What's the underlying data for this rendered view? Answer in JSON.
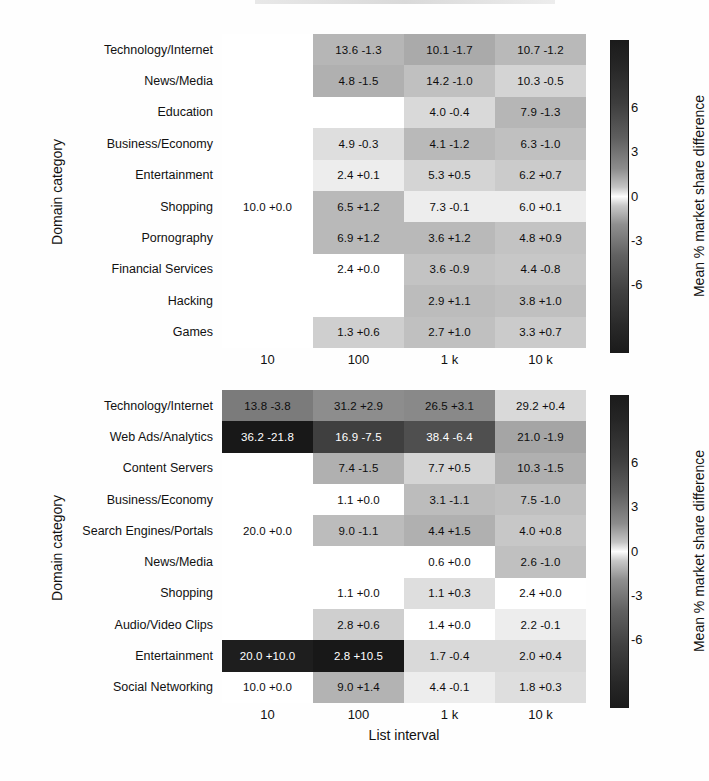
{
  "figure": {
    "y_axis_title": "Domain category",
    "x_axis_title": "List interval",
    "colorbar_title": "Mean % market share difference",
    "colorbar_ticks": [
      "6",
      "3",
      "0",
      "-3",
      "-6"
    ],
    "column_labels": [
      "10",
      "100",
      "1 k",
      "10 k"
    ]
  },
  "chart_data": {
    "type": "heatmap",
    "title": "",
    "xlabel": "List interval",
    "ylabel": "Domain category",
    "colorbar_label": "Mean % market share difference",
    "colorbar_ticks": [
      6,
      3,
      0,
      -3,
      -6
    ],
    "colorbar_range": [
      -10.5,
      10.5
    ],
    "x": [
      "10",
      "100",
      "1 k",
      "10 k"
    ],
    "panels": [
      {
        "panel_index": 0,
        "y": [
          "Technology/Internet",
          "News/Media",
          "Education",
          "Business/Economy",
          "Entertainment",
          "Shopping",
          "Pornography",
          "Financial Services",
          "Hacking",
          "Games"
        ],
        "rows": [
          {
            "label": "Technology/Internet",
            "cells": [
              {
                "text": "",
                "share": null,
                "diff": null
              },
              {
                "text": "13.6 -1.3",
                "share": 13.6,
                "diff": -1.3
              },
              {
                "text": "10.1 -1.7",
                "share": 10.1,
                "diff": -1.7
              },
              {
                "text": "10.7 -1.2",
                "share": 10.7,
                "diff": -1.2
              }
            ]
          },
          {
            "label": "News/Media",
            "cells": [
              {
                "text": "",
                "share": null,
                "diff": null
              },
              {
                "text": "4.8 -1.5",
                "share": 4.8,
                "diff": -1.5
              },
              {
                "text": "14.2 -1.0",
                "share": 14.2,
                "diff": -1.0
              },
              {
                "text": "10.3 -0.5",
                "share": 10.3,
                "diff": -0.5
              }
            ]
          },
          {
            "label": "Education",
            "cells": [
              {
                "text": "",
                "share": null,
                "diff": null
              },
              {
                "text": "",
                "share": null,
                "diff": null
              },
              {
                "text": "4.0 -0.4",
                "share": 4.0,
                "diff": -0.4
              },
              {
                "text": "7.9 -1.3",
                "share": 7.9,
                "diff": -1.3
              }
            ]
          },
          {
            "label": "Business/Economy",
            "cells": [
              {
                "text": "",
                "share": null,
                "diff": null
              },
              {
                "text": "4.9 -0.3",
                "share": 4.9,
                "diff": -0.3
              },
              {
                "text": "4.1 -1.2",
                "share": 4.1,
                "diff": -1.2
              },
              {
                "text": "6.3 -1.0",
                "share": 6.3,
                "diff": -1.0
              }
            ]
          },
          {
            "label": "Entertainment",
            "cells": [
              {
                "text": "",
                "share": null,
                "diff": null
              },
              {
                "text": "2.4 +0.1",
                "share": 2.4,
                "diff": 0.1
              },
              {
                "text": "5.3 +0.5",
                "share": 5.3,
                "diff": 0.5
              },
              {
                "text": "6.2 +0.7",
                "share": 6.2,
                "diff": 0.7
              }
            ]
          },
          {
            "label": "Shopping",
            "cells": [
              {
                "text": "10.0 +0.0",
                "share": 10.0,
                "diff": 0.0
              },
              {
                "text": "6.5 +1.2",
                "share": 6.5,
                "diff": 1.2
              },
              {
                "text": "7.3 -0.1",
                "share": 7.3,
                "diff": -0.1
              },
              {
                "text": "6.0 +0.1",
                "share": 6.0,
                "diff": 0.1
              }
            ]
          },
          {
            "label": "Pornography",
            "cells": [
              {
                "text": "",
                "share": null,
                "diff": null
              },
              {
                "text": "6.9 +1.2",
                "share": 6.9,
                "diff": 1.2
              },
              {
                "text": "3.6 +1.2",
                "share": 3.6,
                "diff": 1.2
              },
              {
                "text": "4.8 +0.9",
                "share": 4.8,
                "diff": 0.9
              }
            ]
          },
          {
            "label": "Financial Services",
            "cells": [
              {
                "text": "",
                "share": null,
                "diff": null
              },
              {
                "text": "2.4 +0.0",
                "share": 2.4,
                "diff": 0.0
              },
              {
                "text": "3.6 -0.9",
                "share": 3.6,
                "diff": -0.9
              },
              {
                "text": "4.4 -0.8",
                "share": 4.4,
                "diff": -0.8
              }
            ]
          },
          {
            "label": "Hacking",
            "cells": [
              {
                "text": "",
                "share": null,
                "diff": null
              },
              {
                "text": "",
                "share": null,
                "diff": null
              },
              {
                "text": "2.9 +1.1",
                "share": 2.9,
                "diff": 1.1
              },
              {
                "text": "3.8 +1.0",
                "share": 3.8,
                "diff": 1.0
              }
            ]
          },
          {
            "label": "Games",
            "cells": [
              {
                "text": "",
                "share": null,
                "diff": null
              },
              {
                "text": "1.3 +0.6",
                "share": 1.3,
                "diff": 0.6
              },
              {
                "text": "2.7 +1.0",
                "share": 2.7,
                "diff": 1.0
              },
              {
                "text": "3.3 +0.7",
                "share": 3.3,
                "diff": 0.7
              }
            ]
          }
        ]
      },
      {
        "panel_index": 1,
        "y": [
          "Technology/Internet",
          "Web Ads/Analytics",
          "Content Servers",
          "Business/Economy",
          "Search Engines/Portals",
          "News/Media",
          "Shopping",
          "Audio/Video Clips",
          "Entertainment",
          "Social Networking"
        ],
        "rows": [
          {
            "label": "Technology/Internet",
            "cells": [
              {
                "text": "13.8 -3.8",
                "share": 13.8,
                "diff": -3.8
              },
              {
                "text": "31.2 +2.9",
                "share": 31.2,
                "diff": 2.9
              },
              {
                "text": "26.5 +3.1",
                "share": 26.5,
                "diff": 3.1
              },
              {
                "text": "29.2 +0.4",
                "share": 29.2,
                "diff": 0.4
              }
            ]
          },
          {
            "label": "Web Ads/Analytics",
            "cells": [
              {
                "text": "36.2 -21.8",
                "share": 36.2,
                "diff": -21.8
              },
              {
                "text": "16.9 -7.5",
                "share": 16.9,
                "diff": -7.5
              },
              {
                "text": "38.4 -6.4",
                "share": 38.4,
                "diff": -6.4
              },
              {
                "text": "21.0 -1.9",
                "share": 21.0,
                "diff": -1.9
              }
            ]
          },
          {
            "label": "Content Servers",
            "cells": [
              {
                "text": "",
                "share": null,
                "diff": null
              },
              {
                "text": "7.4 -1.5",
                "share": 7.4,
                "diff": -1.5
              },
              {
                "text": "7.7 +0.5",
                "share": 7.7,
                "diff": 0.5
              },
              {
                "text": "10.3 -1.5",
                "share": 10.3,
                "diff": -1.5
              }
            ]
          },
          {
            "label": "Business/Economy",
            "cells": [
              {
                "text": "",
                "share": null,
                "diff": null
              },
              {
                "text": "1.1 +0.0",
                "share": 1.1,
                "diff": 0.0
              },
              {
                "text": "3.1 -1.1",
                "share": 3.1,
                "diff": -1.1
              },
              {
                "text": "7.5 -1.0",
                "share": 7.5,
                "diff": -1.0
              }
            ]
          },
          {
            "label": "Search Engines/Portals",
            "cells": [
              {
                "text": "20.0 +0.0",
                "share": 20.0,
                "diff": 0.0
              },
              {
                "text": "9.0 -1.1",
                "share": 9.0,
                "diff": -1.1
              },
              {
                "text": "4.4 +1.5",
                "share": 4.4,
                "diff": 1.5
              },
              {
                "text": "4.0 +0.8",
                "share": 4.0,
                "diff": 0.8
              }
            ]
          },
          {
            "label": "News/Media",
            "cells": [
              {
                "text": "",
                "share": null,
                "diff": null
              },
              {
                "text": "",
                "share": null,
                "diff": null
              },
              {
                "text": "0.6 +0.0",
                "share": 0.6,
                "diff": 0.0
              },
              {
                "text": "2.6 -1.0",
                "share": 2.6,
                "diff": -1.0
              }
            ]
          },
          {
            "label": "Shopping",
            "cells": [
              {
                "text": "",
                "share": null,
                "diff": null
              },
              {
                "text": "1.1 +0.0",
                "share": 1.1,
                "diff": 0.0
              },
              {
                "text": "1.1 +0.3",
                "share": 1.1,
                "diff": 0.3
              },
              {
                "text": "2.4 +0.0",
                "share": 2.4,
                "diff": 0.0
              }
            ]
          },
          {
            "label": "Audio/Video Clips",
            "cells": [
              {
                "text": "",
                "share": null,
                "diff": null
              },
              {
                "text": "2.8 +0.6",
                "share": 2.8,
                "diff": 0.6
              },
              {
                "text": "1.4 +0.0",
                "share": 1.4,
                "diff": 0.0
              },
              {
                "text": "2.2 -0.1",
                "share": 2.2,
                "diff": -0.1
              }
            ]
          },
          {
            "label": "Entertainment",
            "cells": [
              {
                "text": "20.0 +10.0",
                "share": 20.0,
                "diff": 10.0
              },
              {
                "text": "2.8 +10.5",
                "share": 2.8,
                "diff": 10.5
              },
              {
                "text": "1.7 -0.4",
                "share": 1.7,
                "diff": -0.4
              },
              {
                "text": "2.0 +0.4",
                "share": 2.0,
                "diff": 0.4
              }
            ]
          },
          {
            "label": "Social Networking",
            "cells": [
              {
                "text": "10.0 +0.0",
                "share": 10.0,
                "diff": 0.0
              },
              {
                "text": "9.0 +1.4",
                "share": 9.0,
                "diff": 1.4
              },
              {
                "text": "4.4 -0.1",
                "share": 4.4,
                "diff": -0.1
              },
              {
                "text": "1.8 +0.3",
                "share": 1.8,
                "diff": 0.3
              }
            ]
          }
        ]
      }
    ]
  }
}
